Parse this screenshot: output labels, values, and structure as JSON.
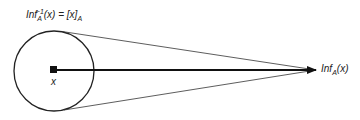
{
  "diagram": {
    "top_label": {
      "base": "Inf",
      "sub": "A",
      "sup": "−1",
      "rest": "(x) = [x]",
      "rest_sub": "A"
    },
    "point_label": "x",
    "target_label": {
      "base": "Inf",
      "sub": "A",
      "rest": "(x)"
    },
    "colors": {
      "stroke": "#222222",
      "fill": "#111111"
    }
  }
}
